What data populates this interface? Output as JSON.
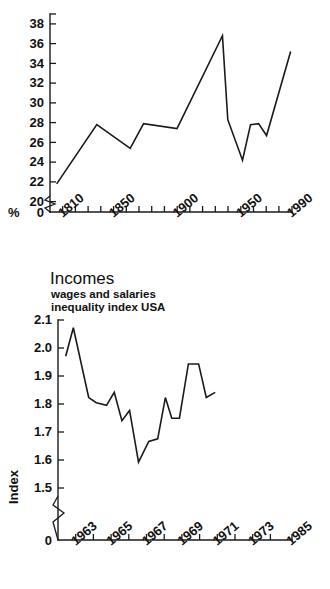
{
  "page": {
    "background": "#ffffff",
    "ink": "#1a1a1a",
    "width": 330,
    "height": 589
  },
  "charts": [
    {
      "id": "top",
      "chart_data": {
        "type": "line",
        "title": "",
        "subtitle": "",
        "xlabel": "",
        "ylabel": "%",
        "xlim": [
          1800,
          1990
        ],
        "ylim": [
          19.0,
          38.0
        ],
        "yaxis_break": true,
        "yaxis_break_to": 0,
        "grid": false,
        "legend": false,
        "ytick_labels": [
          "38",
          "36",
          "34",
          "32",
          "30",
          "28",
          "26",
          "24",
          "22",
          "20",
          "0"
        ],
        "ytick_values": [
          38,
          36,
          34,
          32,
          30,
          28,
          26,
          24,
          22,
          20,
          0
        ],
        "xtick_labels": [
          "1810",
          "1850",
          "1900",
          "1950",
          "1990"
        ],
        "xtick_values": [
          1810,
          1850,
          1900,
          1950,
          1990
        ],
        "xtick_minor": [
          1820,
          1830,
          1840,
          1860,
          1870,
          1880,
          1890,
          1910,
          1920,
          1930,
          1940,
          1960,
          1970,
          1980
        ],
        "series": [
          {
            "name": "share",
            "x": [
              1805,
              1835,
              1860,
              1870,
              1895,
              1929,
              1933,
              1944,
              1950,
              1956,
              1962,
              1980
            ],
            "values": [
              20.8,
              26.8,
              24.4,
              26.9,
              26.4,
              35.8,
              27.3,
              23.2,
              26.8,
              26.9,
              25.7,
              34.2
            ]
          }
        ]
      }
    },
    {
      "id": "bottom",
      "chart_data": {
        "type": "line",
        "title": "Incomes",
        "subtitle_line1": "wages and salaries",
        "subtitle_line2": "inequality index USA",
        "xlabel": "",
        "ylabel": "Index",
        "xlim": [
          1962,
          1985
        ],
        "ylim": [
          1.45,
          2.1
        ],
        "yaxis_break": true,
        "yaxis_break_to": 0,
        "grid": false,
        "legend": false,
        "ytick_labels": [
          "2.1",
          "2.0",
          "1.9",
          "1.8",
          "1.7",
          "1.6",
          "1.5",
          "0"
        ],
        "ytick_values": [
          2.1,
          2.0,
          1.9,
          1.8,
          1.7,
          1.6,
          1.5,
          0
        ],
        "xtick_labels": [
          "1963",
          "1965",
          "1967",
          "1969",
          "1971",
          "1973",
          "1985"
        ],
        "xtick_values": [
          1963,
          1965,
          1967,
          1969,
          1971,
          1973,
          1975
        ],
        "xtick_minor": [
          1964,
          1966,
          1968,
          1970,
          1972,
          1974
        ],
        "series": [
          {
            "name": "inequality index",
            "x": [
              1962.6,
              1963.2,
              1964.4,
              1965.0,
              1965.8,
              1966.4,
              1967.0,
              1967.6,
              1968.3,
              1969.1,
              1969.8,
              1970.4,
              1970.9,
              1971.5,
              1972.2,
              1973.0,
              1973.6,
              1974.3
            ],
            "values": [
              1.96,
              2.07,
              1.8,
              1.78,
              1.77,
              1.82,
              1.71,
              1.75,
              1.55,
              1.63,
              1.64,
              1.8,
              1.72,
              1.72,
              1.93,
              1.93,
              1.8,
              1.82
            ]
          }
        ]
      }
    }
  ]
}
